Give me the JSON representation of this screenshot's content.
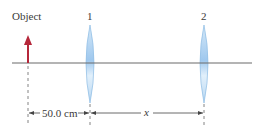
{
  "diagram": {
    "object_label": "Object",
    "lens1_label": "1",
    "lens2_label": "2",
    "distance1_label": "50.0 cm",
    "distance2_label": "x",
    "colors": {
      "axis": "#6b6b6b",
      "arrow": "#b5273a",
      "lens_fill": "#a8cdee",
      "lens_edge": "#7fb2e0",
      "dim_line": "#444444"
    }
  }
}
